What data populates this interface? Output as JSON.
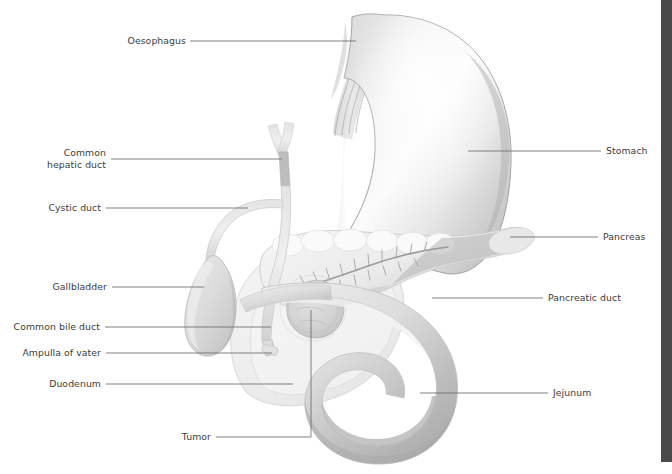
{
  "figure": {
    "background_color": "#ffffff",
    "edge_strip_color": "#4a4a4a",
    "label_color": "#3b3b3b",
    "leader_color": "#6b6b6b"
  },
  "labels": {
    "oesophagus": "Oesophagus",
    "common_hepatic_duct_line1": "Common",
    "common_hepatic_duct_line2": "hepatic duct",
    "cystic_duct": "Cystic duct",
    "gallbladder": "Gallbladder",
    "common_bile_duct": "Common bile duct",
    "ampulla_of_vater": "Ampulla of vater",
    "duodenum": "Duodenum",
    "tumor": "Tumor",
    "stomach": "Stomach",
    "pancreas": "Pancreas",
    "pancreatic_duct": "Pancreatic duct",
    "jejunum": "Jejunum"
  }
}
